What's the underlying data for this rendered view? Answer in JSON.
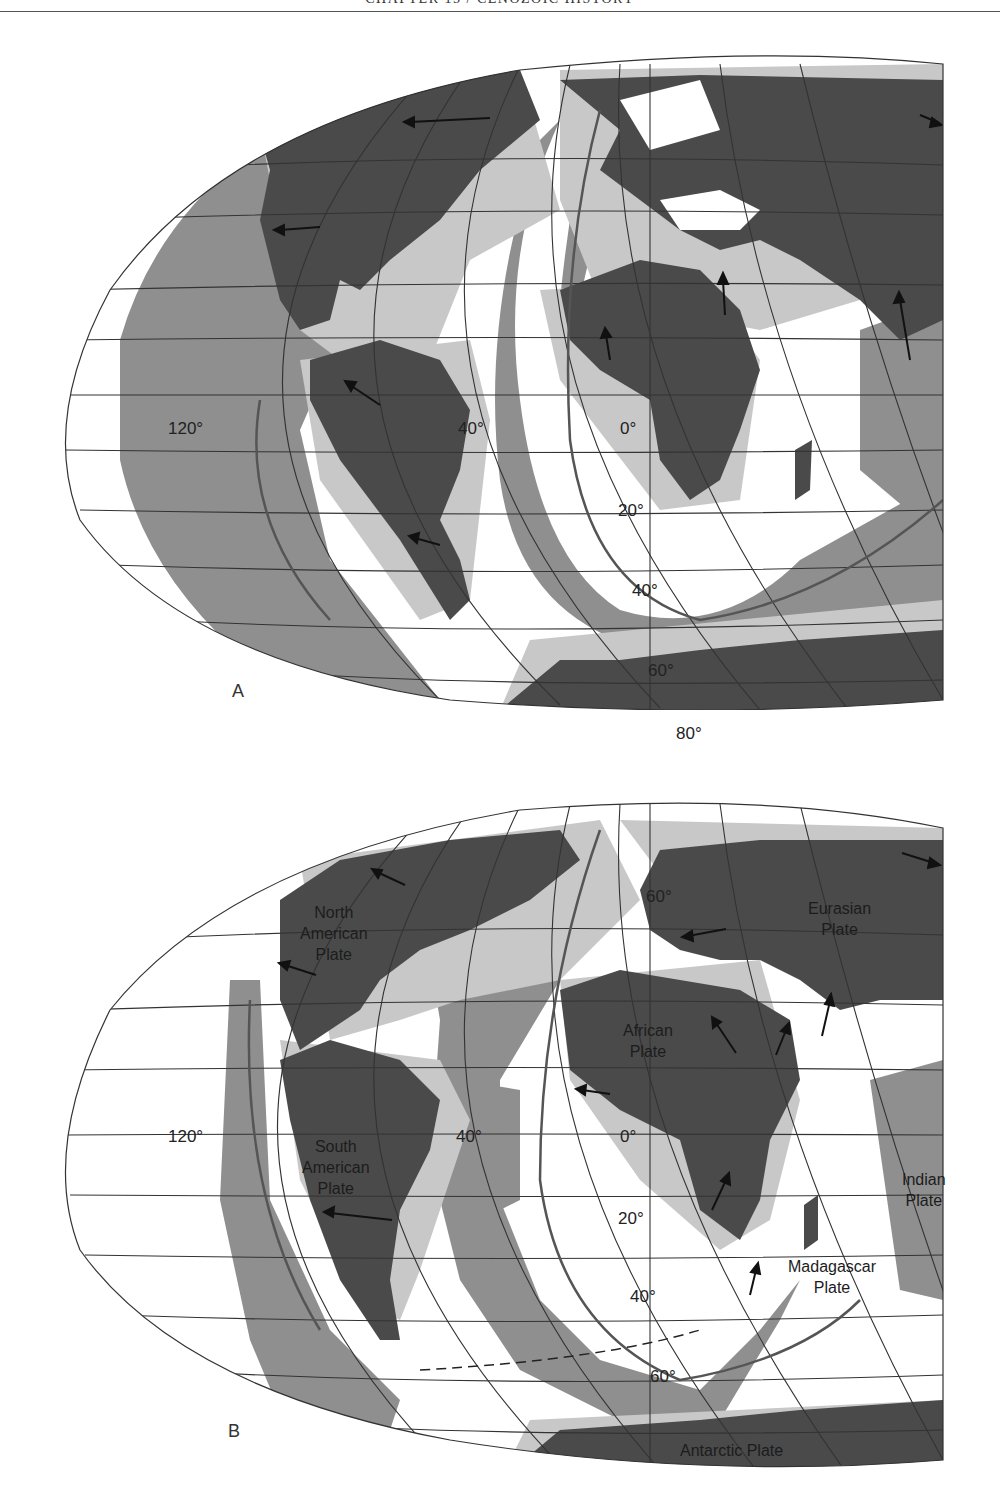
{
  "header": {
    "running_title": "CHAPTER 15 / CENOZOIC HISTORY"
  },
  "colors": {
    "continent": "#4a4a4a",
    "shelf": "#c8c8c8",
    "older_seafloor": "#8f8f8f",
    "young_seafloor": "#ffffff",
    "grid_line": "#333333"
  },
  "map_a": {
    "panel_label": "A",
    "degree_labels": {
      "lon_120": "120°",
      "lon_40": "40°",
      "lon_0": "0°",
      "lat_20": "20°",
      "lat_40": "40°",
      "lat_60": "60°",
      "lat_80": "80°"
    }
  },
  "map_b": {
    "panel_label": "B",
    "degree_labels": {
      "lon_120": "120°",
      "lon_40": "40°",
      "lon_0": "0°",
      "lat_60n": "60°",
      "lat_20": "20°",
      "lat_40": "40°",
      "lat_60": "60°"
    },
    "plates": {
      "north_american": "North\nAmerican\nPlate",
      "eurasian": "Eurasian\nPlate",
      "african": "African\nPlate",
      "south_american": "South\nAmerican\nPlate",
      "indian": "Indian\nPlate",
      "madagascar": "Madagascar\nPlate",
      "antarctic": "Antarctic Plate"
    }
  }
}
